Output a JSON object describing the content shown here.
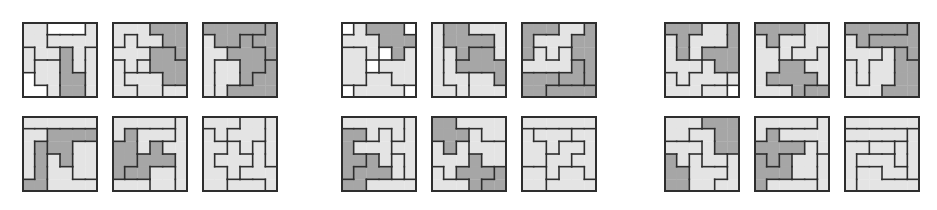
{
  "figure": {
    "grid_size": 6,
    "colors": {
      "L": "#e4e4e4",
      "D": "#a6a6a6",
      "W": "#ffffff",
      "border": "#2e2e2e"
    }
  },
  "groups": [
    {
      "name": "group-left",
      "tiles": [
        {
          "x": 22,
          "y": 22,
          "cells": [
            "AAWWWB",
            "AABBBB",
            "CAADBE",
            "CFFDBE",
            "GFFDDE",
            "GGFDDE"
          ],
          "colors": {
            "A": "L",
            "B": "L",
            "C": "L",
            "D": "D",
            "E": "L",
            "F": "L",
            "G": "W",
            "W": "W"
          }
        },
        {
          "x": 112,
          "y": 22,
          "cells": [
            "AAABBB",
            "ACAABB",
            "CCCDDB",
            "ECEDDD",
            "EFFFDD",
            "EEFFGG"
          ],
          "colors": {
            "A": "L",
            "B": "D",
            "C": "L",
            "D": "D",
            "E": "L",
            "F": "L",
            "G": "L"
          }
        },
        {
          "x": 202,
          "y": 22,
          "cells": [
            "AAAAAB",
            "CAADBB",
            "CCDDDB",
            "CEEDDF",
            "CEEDFF",
            "CEFFFF"
          ],
          "colors": {
            "A": "D",
            "B": "D",
            "C": "L",
            "D": "D",
            "E": "L",
            "F": "D"
          }
        },
        {
          "x": 22,
          "y": 116,
          "cells": [
            "AAAAAA",
            "BBCCCC",
            "BDCCEE",
            "BDFCEE",
            "BDFFEE",
            "DDFFFF"
          ],
          "colors": {
            "A": "L",
            "B": "L",
            "C": "D",
            "D": "D",
            "E": "L",
            "F": "L"
          }
        },
        {
          "x": 112,
          "y": 116,
          "cells": [
            "AAAAAB",
            "ACDDDB",
            "CCDEBB",
            "CCEEEB",
            "CEEFFB",
            "GGGFFB"
          ],
          "colors": {
            "A": "L",
            "B": "L",
            "C": "D",
            "D": "L",
            "E": "D",
            "F": "L",
            "G": "L"
          }
        },
        {
          "x": 202,
          "y": 116,
          "cells": [
            "AAABBC",
            "DABBBC",
            "DDEBFC",
            "DEEEFC",
            "DDEFFF",
            "DDGGGF"
          ],
          "colors": {
            "A": "L",
            "B": "L",
            "C": "L",
            "D": "L",
            "E": "L",
            "F": "L",
            "G": "L"
          }
        }
      ]
    },
    {
      "name": "group-middle",
      "tiles": [
        {
          "x": 341,
          "y": 22,
          "cells": [
            "WABBBW",
            "AAABBB",
            "CCAWBD",
            "CCWDDD",
            "CCEEDD",
            "WEEEEW"
          ],
          "colors": {
            "A": "L",
            "B": "D",
            "C": "L",
            "D": "L",
            "E": "L",
            "W": "W"
          }
        },
        {
          "x": 431,
          "y": 22,
          "cells": [
            "ABBCCC",
            "ABBBBC",
            "ADBEEC",
            "ADEEEE",
            "ADDFFE",
            "AADFFF"
          ],
          "colors": {
            "A": "L",
            "B": "D",
            "C": "L",
            "D": "L",
            "E": "D",
            "F": "L"
          }
        },
        {
          "x": 521,
          "y": 22,
          "cells": [
            "AAABBC",
            "ABBBCC",
            "ADBDCC",
            "DDDDEC",
            "FFFEEC",
            "FFGGGG"
          ],
          "colors": {
            "A": "D",
            "B": "L",
            "C": "D",
            "D": "L",
            "E": "D",
            "F": "D",
            "G": "D"
          }
        },
        {
          "x": 341,
          "y": 116,
          "cells": [
            "AAAAAB",
            "CCADAB",
            "CDDDBB",
            "CCEDFB",
            "CEEEFB",
            "EEGGGG"
          ],
          "colors": {
            "A": "L",
            "B": "L",
            "C": "D",
            "D": "L",
            "E": "D",
            "F": "L",
            "G": "L"
          }
        },
        {
          "x": 431,
          "y": 116,
          "cells": [
            "AABBBB",
            "AAACBB",
            "DADCCC",
            "DDDECC",
            "FDEEEG",
            "FFFEGG"
          ],
          "colors": {
            "A": "D",
            "B": "L",
            "C": "L",
            "D": "L",
            "E": "D",
            "F": "L",
            "G": "D"
          }
        },
        {
          "x": 521,
          "y": 116,
          "cells": [
            "AAAAAA",
            "BCCCDD",
            "BBCEED",
            "BBEEDD",
            "FFEGGD",
            "FFGGGG"
          ],
          "colors": {
            "A": "L",
            "B": "L",
            "C": "L",
            "D": "L",
            "E": "L",
            "F": "L",
            "G": "L"
          }
        }
      ]
    },
    {
      "name": "group-right",
      "tiles": [
        {
          "x": 664,
          "y": 22,
          "cells": [
            "AAABBC",
            "DABBBC",
            "DABCCC",
            "DDDECC",
            "EDEEEF",
            "EEEFFW"
          ],
          "colors": {
            "A": "D",
            "B": "L",
            "C": "D",
            "D": "L",
            "E": "L",
            "F": "L",
            "W": "W"
          }
        },
        {
          "x": 754,
          "y": 22,
          "cells": [
            "AAAABB",
            "CADDBB",
            "CCDBBE",
            "CCFFEE",
            "CFFFFE",
            "CCCFGG"
          ],
          "colors": {
            "A": "D",
            "B": "L",
            "C": "L",
            "D": "L",
            "E": "L",
            "F": "D",
            "G": "D"
          }
        },
        {
          "x": 844,
          "y": 22,
          "cells": [
            "AAAAAB",
            "CABBBB",
            "CCCDEB",
            "DCDDEE",
            "DCDDEE",
            "DDDEEE"
          ],
          "colors": {
            "A": "D",
            "B": "D",
            "C": "L",
            "D": "L",
            "E": "D"
          }
        },
        {
          "x": 664,
          "y": 116,
          "cells": [
            "AAABBB",
            "AACCBB",
            "DDDCBB",
            "EDFCCG",
            "EEFFFG",
            "EEFFGG"
          ],
          "colors": {
            "A": "L",
            "B": "D",
            "C": "L",
            "D": "L",
            "E": "D",
            "F": "L",
            "G": "L"
          }
        },
        {
          "x": 754,
          "y": 116,
          "cells": [
            "AAAAAB",
            "ACBBBB",
            "CCCCDB",
            "ECEDDF",
            "EEEDDF",
            "EGGGGF"
          ],
          "colors": {
            "A": "L",
            "B": "L",
            "C": "D",
            "D": "L",
            "E": "D",
            "F": "L",
            "G": "L"
          }
        },
        {
          "x": 844,
          "y": 116,
          "cells": [
            "AAAAAA",
            "BBBBBC",
            "DDEEFC",
            "DGGGFC",
            "DHHGGC",
            "DHHHHH"
          ],
          "colors": {
            "A": "L",
            "B": "L",
            "C": "L",
            "D": "L",
            "E": "L",
            "F": "L",
            "G": "L",
            "H": "L"
          }
        }
      ]
    }
  ]
}
